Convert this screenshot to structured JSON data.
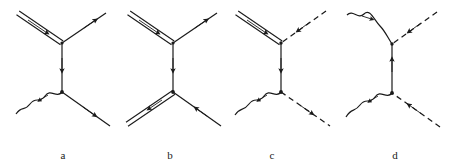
{
  "figure": {
    "background_color": "#ffffff",
    "line_color": "#1a1a1a",
    "width": 450,
    "height": 168,
    "panel_count": 4
  },
  "panels": [
    {
      "id": "a",
      "label": "a",
      "label_position": {
        "x": 60,
        "y": 155
      },
      "vertices": [
        {
          "name": "upper-vertex",
          "x": 62,
          "y": 43
        },
        {
          "name": "lower-vertex",
          "x": 62,
          "y": 92
        }
      ],
      "legs": [
        {
          "name": "upper-left-leg",
          "style": "double-solid",
          "from": [
            18,
            13
          ],
          "to": [
            62,
            43
          ],
          "arrow": "toward-vertex",
          "arrow_direction": "down-right"
        },
        {
          "name": "upper-right-leg",
          "style": "single-solid",
          "from": [
            62,
            43
          ],
          "to": [
            106,
            13
          ],
          "arrow": "away-from-vertex",
          "arrow_direction": "up-right"
        },
        {
          "name": "internal-propagator",
          "style": "single-solid",
          "from": [
            62,
            43
          ],
          "to": [
            62,
            92
          ],
          "arrow": "downward",
          "arrow_direction": "down"
        },
        {
          "name": "lower-left-leg",
          "style": "wavy",
          "from": [
            62,
            92
          ],
          "to": [
            14,
            117
          ],
          "arrow": "away-from-vertex",
          "arrow_direction": "down-left"
        },
        {
          "name": "lower-right-leg",
          "style": "single-solid",
          "from": [
            62,
            92
          ],
          "to": [
            110,
            126
          ],
          "arrow": "away-from-vertex",
          "arrow_direction": "down-right"
        }
      ]
    },
    {
      "id": "b",
      "label": "b",
      "label_position": {
        "x": 167,
        "y": 155
      },
      "vertices": [
        {
          "name": "upper-vertex",
          "x": 173,
          "y": 43
        },
        {
          "name": "lower-vertex",
          "x": 173,
          "y": 92
        }
      ],
      "legs": [
        {
          "name": "upper-left-leg",
          "style": "double-solid",
          "from": [
            129,
            13
          ],
          "to": [
            173,
            43
          ],
          "arrow": "toward-vertex",
          "arrow_direction": "down-right"
        },
        {
          "name": "upper-right-leg",
          "style": "single-solid",
          "from": [
            173,
            43
          ],
          "to": [
            217,
            13
          ],
          "arrow": "away-from-vertex",
          "arrow_direction": "up-right"
        },
        {
          "name": "internal-propagator",
          "style": "single-solid",
          "from": [
            173,
            43
          ],
          "to": [
            173,
            92
          ],
          "arrow": "downward",
          "arrow_direction": "down"
        },
        {
          "name": "lower-left-leg",
          "style": "double-solid",
          "from": [
            173,
            92
          ],
          "to": [
            126,
            124
          ],
          "arrow": "away-from-vertex",
          "arrow_direction": "down-left"
        },
        {
          "name": "lower-right-leg",
          "style": "single-solid",
          "from": [
            221,
            126
          ],
          "to": [
            173,
            92
          ],
          "arrow": "toward-vertex",
          "arrow_direction": "up-left"
        }
      ]
    },
    {
      "id": "c",
      "label": "c",
      "label_position": {
        "x": 269,
        "y": 155
      },
      "vertices": [
        {
          "name": "upper-vertex",
          "x": 281,
          "y": 43
        },
        {
          "name": "lower-vertex",
          "x": 281,
          "y": 92
        }
      ],
      "legs": [
        {
          "name": "upper-left-leg",
          "style": "double-solid",
          "from": [
            237,
            13
          ],
          "to": [
            281,
            43
          ],
          "arrow": "toward-vertex",
          "arrow_direction": "down-right"
        },
        {
          "name": "upper-right-leg",
          "style": "dashed",
          "from": [
            326,
            11
          ],
          "to": [
            281,
            43
          ],
          "arrow": "toward-vertex",
          "arrow_direction": "down-left"
        },
        {
          "name": "internal-propagator",
          "style": "single-solid",
          "from": [
            281,
            43
          ],
          "to": [
            281,
            92
          ],
          "arrow": "downward",
          "arrow_direction": "down"
        },
        {
          "name": "lower-left-leg",
          "style": "wavy",
          "from": [
            281,
            92
          ],
          "to": [
            233,
            120
          ],
          "arrow": "away-from-vertex",
          "arrow_direction": "down-left"
        },
        {
          "name": "lower-right-leg",
          "style": "dashed",
          "from": [
            281,
            92
          ],
          "to": [
            330,
            126
          ],
          "arrow": "away-from-vertex",
          "arrow_direction": "down-right"
        }
      ]
    },
    {
      "id": "d",
      "label": "d",
      "label_position": {
        "x": 392,
        "y": 155
      },
      "vertices": [
        {
          "name": "upper-vertex",
          "x": 392,
          "y": 44
        },
        {
          "name": "lower-vertex",
          "x": 392,
          "y": 93
        }
      ],
      "legs": [
        {
          "name": "upper-left-leg",
          "style": "wavy",
          "from": [
            348,
            14
          ],
          "to": [
            392,
            44
          ],
          "arrow": "toward-vertex",
          "arrow_direction": "right"
        },
        {
          "name": "upper-right-leg",
          "style": "dashed",
          "from": [
            437,
            12
          ],
          "to": [
            392,
            44
          ],
          "arrow": "toward-vertex",
          "arrow_direction": "down-left"
        },
        {
          "name": "internal-propagator",
          "style": "single-solid",
          "from": [
            392,
            93
          ],
          "to": [
            392,
            44
          ],
          "arrow": "upward",
          "arrow_direction": "up"
        },
        {
          "name": "lower-left-leg",
          "style": "wavy",
          "from": [
            392,
            93
          ],
          "to": [
            346,
            122
          ],
          "arrow": "away-from-vertex",
          "arrow_direction": "down-left"
        },
        {
          "name": "lower-right-leg",
          "style": "dashed",
          "from": [
            440,
            127
          ],
          "to": [
            392,
            93
          ],
          "arrow": "toward-vertex",
          "arrow_direction": "up-left"
        }
      ]
    }
  ],
  "legend": {
    "line_styles": [
      "double-solid",
      "single-solid",
      "dashed",
      "wavy"
    ]
  }
}
